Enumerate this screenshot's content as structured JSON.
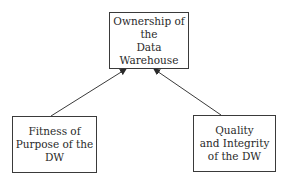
{
  "diagram": {
    "nodes": [
      {
        "id": "top",
        "label": "Ownership of the\nData Warehouse"
      },
      {
        "id": "left",
        "label": "Fitness of\nPurpose of the\nDW"
      },
      {
        "id": "right",
        "label": "Quality\nand Integrity\nof the DW"
      }
    ],
    "edges": [
      {
        "from": "left",
        "to": "top"
      },
      {
        "from": "right",
        "to": "top"
      }
    ],
    "colors": {
      "stroke": "#3a3a3a",
      "text": "#2a2a2a",
      "background": "#ffffff"
    }
  }
}
